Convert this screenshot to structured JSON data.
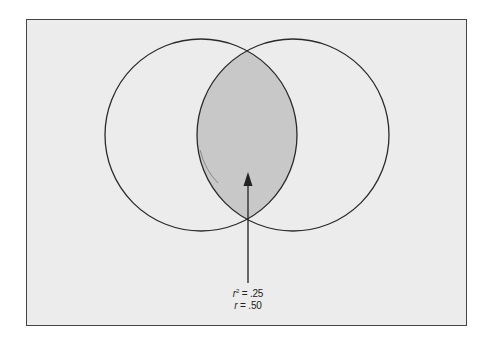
{
  "diagram": {
    "circles": [
      {
        "name": "variable-a",
        "cx": 201,
        "cy": 135,
        "r": 96
      },
      {
        "name": "variable-b",
        "cx": 293,
        "cy": 135,
        "r": 96
      }
    ],
    "overlap_fill": "#c8c8c8",
    "background": "#ececec",
    "stroke": "#2a2a2a",
    "annotation": {
      "r_squared_symbol": "r",
      "r_squared_exp": "2",
      "r_squared_value": "= .25",
      "r_symbol": "r",
      "r_value": "= .50"
    }
  }
}
